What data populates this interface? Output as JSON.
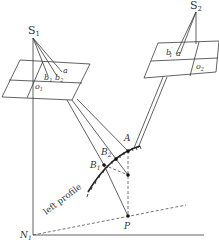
{
  "diagram": {
    "type": "stereo-photogrammetry-geometry",
    "labels": {
      "s1": "S",
      "s1_sub": "1",
      "s2": "S",
      "s2_sub": "2",
      "b1": "b",
      "b1_sub": "1",
      "b2": "b",
      "b2_sub": "2",
      "a": "a",
      "b1_prime": "b",
      "b1_prime_sub": "1",
      "b1_prime_mark": "′",
      "a_prime": "a",
      "a_prime_mark": "′",
      "o1": "o",
      "o1_sub": "1",
      "o2": "o",
      "o2_sub": "2",
      "A": "A",
      "B1": "B",
      "B1_sub": "1",
      "B2": "B",
      "B2_sub": "2",
      "P": "P",
      "N1": "N",
      "N1_sub": "1",
      "profile": "left profile"
    },
    "colors": {
      "line": "#3a3a3a",
      "text": "#333333",
      "background": "#ffffff"
    }
  }
}
